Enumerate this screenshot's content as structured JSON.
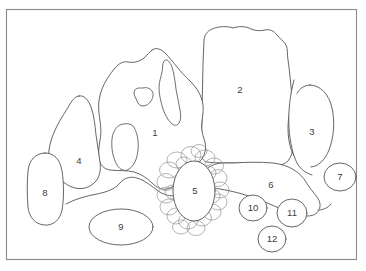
{
  "figure": {
    "frame": {
      "x": 6,
      "y": 9,
      "width": 351,
      "height": 251,
      "color": "#8a8a8a"
    },
    "style": {
      "background": "#ffffff",
      "outline_color": "#4a4a4a",
      "cluster_color": "#8b8b93",
      "label_color": "#3c3c3c"
    },
    "regions": [
      {
        "id": "region-1",
        "label": "1",
        "label_x": 155,
        "label_y": 133,
        "kind": "irregular-boulder-with-holes"
      },
      {
        "id": "region-2",
        "label": "2",
        "label_x": 240,
        "label_y": 90,
        "kind": "tall-boulder"
      },
      {
        "id": "region-3",
        "label": "3",
        "label_x": 312,
        "label_y": 132,
        "kind": "oval-boulder"
      },
      {
        "id": "region-4",
        "label": "4",
        "label_x": 79,
        "label_y": 161,
        "kind": "teardrop-boulder"
      },
      {
        "id": "region-5",
        "label": "5",
        "label_x": 195,
        "label_y": 191,
        "kind": "oval-in-cobble-cluster"
      },
      {
        "id": "region-6",
        "label": "6",
        "label_x": 271,
        "label_y": 185,
        "kind": "flat-slab"
      },
      {
        "id": "region-7",
        "label": "7",
        "label_x": 340,
        "label_y": 177,
        "kind": "small-circle"
      },
      {
        "id": "region-8",
        "label": "8",
        "label_x": 45,
        "label_y": 193,
        "kind": "rounded-rectangle"
      },
      {
        "id": "region-9",
        "label": "9",
        "label_x": 121,
        "label_y": 227,
        "kind": "ellipse"
      },
      {
        "id": "region-10",
        "label": "10",
        "label_x": 253,
        "label_y": 208,
        "kind": "small-circle"
      },
      {
        "id": "region-11",
        "label": "11",
        "label_x": 292,
        "label_y": 213,
        "kind": "small-circle"
      },
      {
        "id": "region-12",
        "label": "12",
        "label_x": 272,
        "label_y": 239,
        "kind": "small-circle"
      }
    ],
    "cluster": {
      "name": "cobble-cluster-around-region-5",
      "stone_count": 22
    }
  }
}
